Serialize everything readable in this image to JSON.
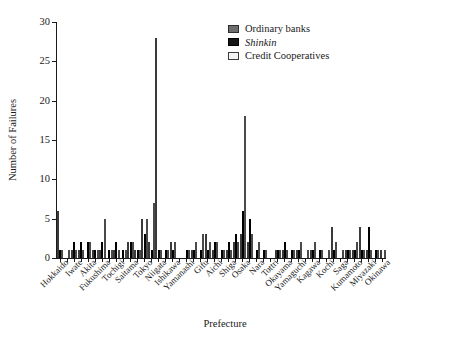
{
  "chart_data": {
    "type": "bar",
    "title": "",
    "xlabel": "Prefecture",
    "ylabel": "Number of Failures",
    "ylim": [
      0,
      30
    ],
    "yticks": [
      0,
      5,
      10,
      15,
      20,
      25,
      30
    ],
    "grid": false,
    "legend_position": "top-right",
    "categories": [
      "Hokkaido",
      "Aomori",
      "Iwate",
      "Miyagi",
      "Akita",
      "Yamagata",
      "Fukushima",
      "Ibaraki",
      "Tochigi",
      "Gunma",
      "Saitama",
      "Chiba",
      "Tokyo",
      "Kanagawa",
      "Niigata",
      "Toyama",
      "Ishikawa",
      "Fukui",
      "Yamanashi",
      "Nagano",
      "Gifu",
      "Shizuoka",
      "Aichi",
      "Mie",
      "Shiga",
      "Kyoto",
      "Osaka",
      "Hyogo",
      "Nara",
      "Wakayama",
      "Tottori",
      "Shimane",
      "Okayama",
      "Hiroshima",
      "Yamaguchi",
      "Tokushima",
      "Kagawa",
      "Ehime",
      "Kochi",
      "Fukuoka",
      "Saga",
      "Nagasaki",
      "Kumamoto",
      "Oita",
      "Miyazaki",
      "Kagoshima",
      "Okinawa"
    ],
    "tick_labels": [
      "Hokkaido",
      "Iwate",
      "Akita",
      "Fukushima",
      "Tochigi",
      "Saitama",
      "Tokyo",
      "Niigata",
      "Ishikawa",
      "Yamanashi",
      "Gifu",
      "Aichi",
      "Shiga",
      "Osaka",
      "Nara",
      "Tottri",
      "Okayama",
      "Yamaguchi",
      "Kagawa",
      "Kochi",
      "Saga",
      "Kumamoto",
      "Miyazaki",
      "Okinawa"
    ],
    "series": [
      {
        "name": "Ordinary banks",
        "color": "#6e6e6e",
        "values": [
          6,
          0,
          1,
          1,
          0,
          1,
          1,
          0,
          1,
          0,
          2,
          1,
          5,
          2,
          28,
          0,
          2,
          0,
          0,
          1,
          0,
          3,
          1,
          0,
          1,
          2,
          3,
          2,
          0,
          0,
          0,
          1,
          1,
          0,
          1,
          0,
          1,
          0,
          0,
          4,
          0,
          1,
          1,
          4,
          1,
          0,
          1
        ]
      },
      {
        "name": "Shinkin",
        "color": "#141414",
        "values": [
          1,
          0,
          2,
          2,
          2,
          1,
          2,
          1,
          2,
          1,
          2,
          1,
          3,
          1,
          1,
          1,
          1,
          0,
          1,
          1,
          1,
          1,
          2,
          1,
          2,
          3,
          6,
          5,
          1,
          1,
          0,
          1,
          2,
          1,
          1,
          0,
          1,
          1,
          0,
          1,
          0,
          1,
          1,
          1,
          4,
          1,
          0
        ]
      },
      {
        "name": "Credit Cooperatives",
        "color": "#f2f2f2",
        "values": [
          1,
          1,
          1,
          1,
          2,
          1,
          5,
          1,
          1,
          1,
          2,
          1,
          5,
          7,
          1,
          1,
          2,
          0,
          1,
          2,
          3,
          2,
          2,
          1,
          1,
          2,
          18,
          3,
          2,
          1,
          0,
          1,
          1,
          1,
          2,
          1,
          2,
          1,
          1,
          2,
          1,
          1,
          2,
          1,
          1,
          1,
          1
        ]
      }
    ]
  },
  "legend": {
    "items": [
      {
        "label": "Ordinary banks",
        "style": "normal"
      },
      {
        "label": "Shinkin",
        "style": "italic"
      },
      {
        "label": "Credit Cooperatives",
        "style": "normal"
      }
    ]
  },
  "axes": {
    "y_title": "Number of Failures",
    "x_title": "Prefecture"
  },
  "caption": ""
}
